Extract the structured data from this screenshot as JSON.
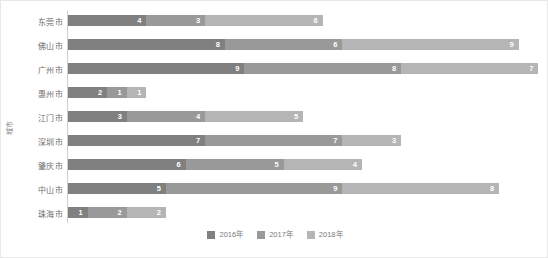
{
  "chart_data": {
    "type": "bar",
    "orientation": "horizontal",
    "stacked": true,
    "title": "",
    "xlabel": "",
    "ylabel": "城市",
    "grid": false,
    "legend_position": "bottom",
    "categories": [
      "东莞市",
      "佛山市",
      "广州市",
      "惠州市",
      "江门市",
      "深圳市",
      "肇庆市",
      "中山市",
      "珠海市"
    ],
    "series": [
      {
        "name": "2016年",
        "color": "#808080",
        "values": [
          4,
          8,
          9,
          2,
          3,
          7,
          6,
          5,
          1
        ]
      },
      {
        "name": "2017年",
        "color": "#999999",
        "values": [
          3,
          6,
          8,
          1,
          4,
          7,
          5,
          9,
          2
        ]
      },
      {
        "name": "2018年",
        "color": "#b5b5b5",
        "values": [
          6,
          9,
          7,
          1,
          5,
          3,
          4,
          8,
          2
        ]
      }
    ],
    "totals": [
      13,
      23,
      24,
      4,
      12,
      17,
      15,
      22,
      5
    ],
    "xlim": [
      0,
      24
    ],
    "unit_px": 19.6
  },
  "axis": {
    "y_title": "城市"
  },
  "legend": {
    "items": [
      {
        "label": "2016年",
        "color": "#808080"
      },
      {
        "label": "2017年",
        "color": "#999999"
      },
      {
        "label": "2018年",
        "color": "#b5b5b5"
      }
    ]
  }
}
